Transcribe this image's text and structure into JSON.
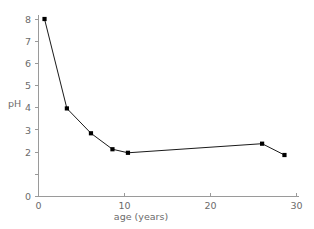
{
  "chart_data": {
    "type": "line",
    "title": "",
    "xlabel": "age (years)",
    "ylabel": "pH",
    "xlim": [
      0,
      30
    ],
    "ylim": [
      0,
      8
    ],
    "xticks": [
      0,
      10,
      20,
      30
    ],
    "xtick_labels": [
      "0",
      "10",
      "20",
      "30"
    ],
    "yticks": [
      0,
      1,
      2,
      3,
      4,
      5,
      6,
      7,
      8
    ],
    "ytick_labels": [
      "0",
      "1",
      "2",
      "3",
      "4",
      "5",
      "6",
      "7",
      "8"
    ],
    "ytick_labels_shown": [
      "0",
      "2",
      "3",
      "4",
      "5",
      "6",
      "7",
      "8"
    ],
    "grid": false,
    "legend": false,
    "marker": "square",
    "line_color": "#1a1a1a",
    "marker_color": "#000000",
    "axis_color": "#9a9a9a",
    "background_color": "#ffffff",
    "series": [
      {
        "name": "pH",
        "x": [
          0.7,
          3.3,
          6.1,
          8.6,
          10.4,
          26.0,
          28.6
        ],
        "y": [
          8.0,
          3.97,
          2.85,
          2.13,
          1.97,
          2.38,
          1.87
        ],
        "points": [
          {
            "x": 0.7,
            "y": 8.0
          },
          {
            "x": 3.3,
            "y": 3.97
          },
          {
            "x": 6.1,
            "y": 2.85
          },
          {
            "x": 8.6,
            "y": 2.13
          },
          {
            "x": 10.4,
            "y": 1.97
          },
          {
            "x": 26.0,
            "y": 2.38
          },
          {
            "x": 28.6,
            "y": 1.87
          }
        ]
      }
    ]
  }
}
